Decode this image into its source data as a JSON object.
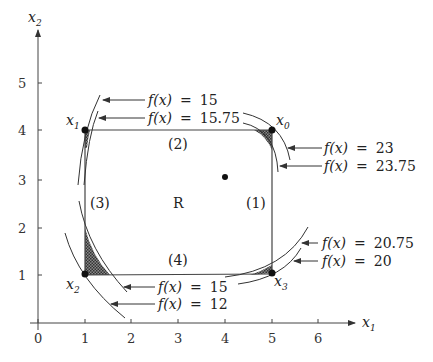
{
  "axes": {
    "x_label": "x",
    "x_label_sub": "1",
    "y_label": "x",
    "y_label_sub": "2",
    "x_ticks": [
      "0",
      "1",
      "2",
      "3",
      "4",
      "5",
      "6"
    ],
    "y_ticks": [
      "1",
      "2",
      "3",
      "4",
      "5"
    ]
  },
  "region": {
    "label": "R",
    "constraints": [
      {
        "id": "1",
        "label": "(1)"
      },
      {
        "id": "2",
        "label": "(2)"
      },
      {
        "id": "3",
        "label": "(3)"
      },
      {
        "id": "4",
        "label": "(4)"
      }
    ]
  },
  "points": [
    {
      "name": "x",
      "sub": "0",
      "x": 5,
      "y": 4
    },
    {
      "name": "x",
      "sub": "1",
      "x": 1,
      "y": 4
    },
    {
      "name": "x",
      "sub": "2",
      "x": 1,
      "y": 1
    },
    {
      "name": "x",
      "sub": "3",
      "x": 5,
      "y": 1
    }
  ],
  "center_point": {
    "x": 4,
    "y": 3
  },
  "contours": {
    "x1_outer": {
      "fx": "f(x)",
      "eq": "=",
      "value": "15"
    },
    "x1_inner": {
      "fx": "f(x)",
      "eq": "=",
      "value": "15.75"
    },
    "x0_outer": {
      "fx": "f(x)",
      "eq": "=",
      "value": "23"
    },
    "x0_inner": {
      "fx": "f(x)",
      "eq": "=",
      "value": "23.75"
    },
    "x3_inner": {
      "fx": "f(x)",
      "eq": "=",
      "value": "20.75"
    },
    "x3_outer": {
      "fx": "f(x)",
      "eq": "=",
      "value": "20"
    },
    "x2_inner": {
      "fx": "f(x)",
      "eq": "=",
      "value": "15"
    },
    "x2_outer": {
      "fx": "f(x)",
      "eq": "=",
      "value": "12"
    }
  },
  "colors": {
    "line": "#333333",
    "shade": "#555555"
  }
}
